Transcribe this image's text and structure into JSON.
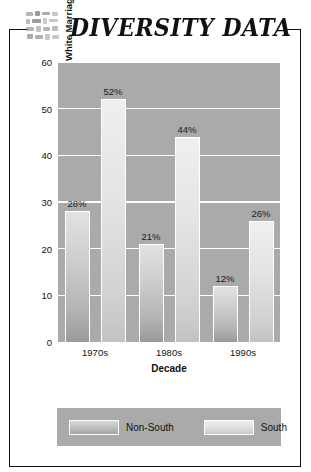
{
  "header": {
    "title": "DIVERSITY DATA",
    "icon": "mosaic-tiles-icon"
  },
  "chart_data": {
    "type": "bar",
    "title": "",
    "categories": [
      "1970s",
      "1980s",
      "1990s"
    ],
    "series": [
      {
        "name": "Non-South",
        "values": [
          28,
          21,
          12
        ],
        "labels": [
          "28%",
          "21%",
          "12%"
        ]
      },
      {
        "name": "South",
        "values": [
          52,
          44,
          26
        ],
        "labels": [
          "52%",
          "44%",
          "26%"
        ]
      }
    ],
    "xlabel": "Decade",
    "ylabel": "Percent of Whites Favoring Laws against Black–White Marriage",
    "ylim": [
      0,
      60
    ],
    "yticks": [
      0,
      10,
      20,
      30,
      40,
      50,
      60
    ],
    "ytick_labels": [
      "0",
      "10",
      "20",
      "30",
      "40",
      "50",
      "60"
    ],
    "grid": true,
    "legend_position": "bottom",
    "plot_background": "#aaaaaa",
    "gridline_color": "#ffffff",
    "series_colors": [
      "#bdbdbd",
      "#dedede"
    ]
  }
}
